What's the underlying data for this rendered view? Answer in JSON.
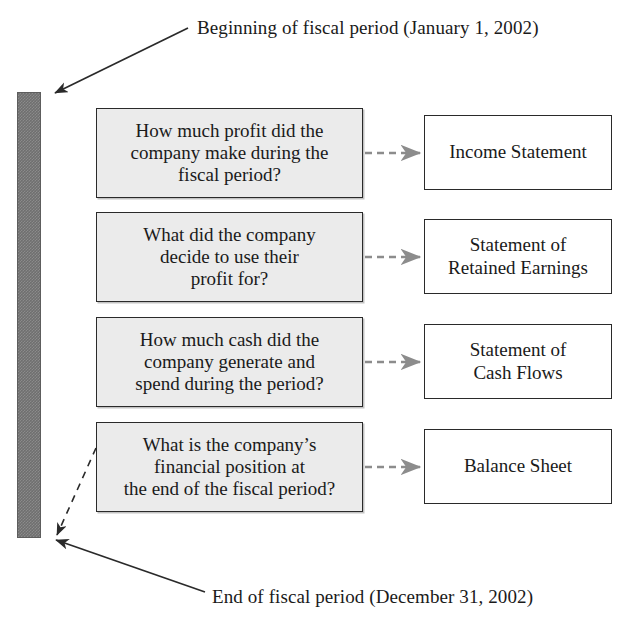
{
  "figure": {
    "type": "flow-diagram",
    "top_label": "Beginning of fiscal period (January 1, 2002)",
    "bottom_label": "End of fiscal period (December 31, 2002)",
    "timeline": {
      "name": "fiscal-period-bar",
      "color": "#6f6f6f",
      "start": "January 1, 2002",
      "end": "December 31, 2002"
    },
    "colors": {
      "question_fill": "#ebebeb",
      "statement_fill": "#ffffff",
      "border": "#2a2a2a",
      "connector": "#8c8c8c",
      "bar": "#6f6f6f"
    },
    "rows": [
      {
        "question": "How much profit did the company make during the fiscal period?",
        "question_lines": [
          "How much profit did the",
          "company make during the",
          "fiscal period?"
        ],
        "statement": "Income Statement",
        "statement_lines": [
          "Income Statement"
        ]
      },
      {
        "question": "What did the company decide to use their profit for?",
        "question_lines": [
          "What did the company",
          "decide to use their",
          "profit for?"
        ],
        "statement": "Statement of Retained Earnings",
        "statement_lines": [
          "Statement of",
          "Retained Earnings"
        ]
      },
      {
        "question": "How much cash did the company generate and spend during the period?",
        "question_lines": [
          "How much cash did the",
          "company generate and",
          "spend during the period?"
        ],
        "statement": "Statement of Cash Flows",
        "statement_lines": [
          "Statement of",
          "Cash Flows"
        ]
      },
      {
        "question": "What is the company’s financial position at the end of the fiscal period?",
        "question_lines": [
          "What is the company’s",
          "financial position at",
          "the end of the fiscal period?"
        ],
        "statement": "Balance Sheet",
        "statement_lines": [
          "Balance Sheet"
        ]
      }
    ]
  }
}
